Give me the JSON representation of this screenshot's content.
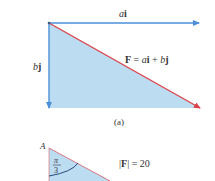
{
  "figure_a": {
    "horizontal_label_var": "a",
    "horizontal_label_unit": "i",
    "vertical_label_var": "b",
    "vertical_label_unit": "j",
    "vector_label": {
      "name": "F",
      "eq": " = ",
      "a": "a",
      "i": "i",
      "plus": " + ",
      "b": "b",
      "j": "j"
    },
    "caption": "(a)",
    "colors": {
      "component_arrows": "#4a90d9",
      "resultant_arrow": "#d9434a",
      "fill": "#bcdcf2"
    }
  },
  "figure_b": {
    "point_label": "A",
    "angle_num": "π",
    "angle_den": "3",
    "magnitude_label": "|F| = 20",
    "mag_bar_l": "|",
    "mag_name": "F",
    "mag_bar_r": "|",
    "mag_eq": " = 20"
  }
}
